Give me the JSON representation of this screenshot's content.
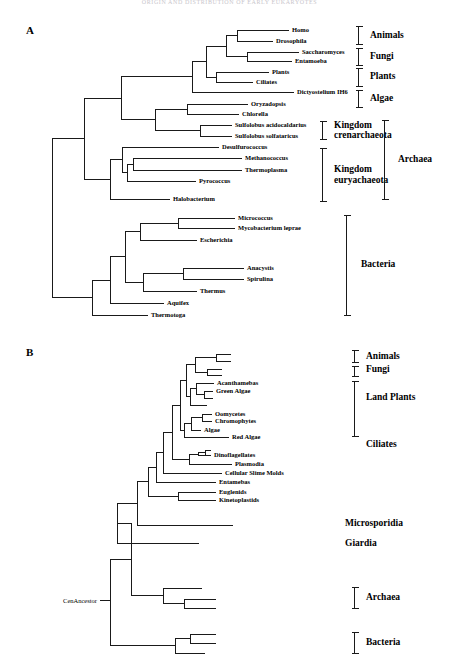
{
  "document": {
    "running_head": "ORIGIN AND DISTRIBUTION OF EARLY EUKARYOTES",
    "width": 459,
    "height": 670,
    "line_color": "#1a1a1a",
    "background": "#ffffff"
  },
  "panels": [
    {
      "letter": "A",
      "tips": [
        {
          "label": "Homo",
          "x": 289,
          "y": 30,
          "side": "right"
        },
        {
          "label": "Drosophila",
          "x": 273,
          "y": 41,
          "side": "right"
        },
        {
          "label": "Saccharomyces",
          "x": 299,
          "y": 52,
          "side": "right"
        },
        {
          "label": "Entamoeba",
          "x": 292,
          "y": 61,
          "side": "right"
        },
        {
          "label": "Plants",
          "x": 269,
          "y": 72,
          "side": "right"
        },
        {
          "label": "Ciliates",
          "x": 253,
          "y": 82,
          "side": "right"
        },
        {
          "label": "Dictyostelium IH6",
          "x": 294,
          "y": 92,
          "side": "right"
        },
        {
          "label": "Oryzadopsis",
          "x": 248,
          "y": 104,
          "side": "right"
        },
        {
          "label": "Chlorella",
          "x": 239,
          "y": 114,
          "side": "right"
        },
        {
          "label": "Sulfolobus acidocaldarius",
          "x": 232,
          "y": 125,
          "side": "right"
        },
        {
          "label": "Sulfolobus solfataricus",
          "x": 232,
          "y": 136,
          "side": "right"
        },
        {
          "label": "Desulfurococcus",
          "x": 219,
          "y": 147,
          "side": "right"
        },
        {
          "label": "Methanococcus",
          "x": 242,
          "y": 158,
          "side": "right"
        },
        {
          "label": "Thermoplasma",
          "x": 242,
          "y": 170,
          "side": "right"
        },
        {
          "label": "Pyrococcus",
          "x": 196,
          "y": 181,
          "side": "right"
        },
        {
          "label": "Halobacterium",
          "x": 170,
          "y": 199,
          "side": "right"
        },
        {
          "label": "Micrococcus",
          "x": 235,
          "y": 218,
          "side": "right"
        },
        {
          "label": "Mycobacterium leprae",
          "x": 235,
          "y": 228,
          "side": "right"
        },
        {
          "label": "Escherichia",
          "x": 197,
          "y": 240,
          "side": "right"
        },
        {
          "label": "Anacystis",
          "x": 244,
          "y": 268,
          "side": "right"
        },
        {
          "label": "Spirulina",
          "x": 244,
          "y": 279,
          "side": "right"
        },
        {
          "label": "Thermus",
          "x": 197,
          "y": 291,
          "side": "right"
        },
        {
          "label": "Aquifex",
          "x": 164,
          "y": 303,
          "side": "right"
        },
        {
          "label": "Thermotoga",
          "x": 148,
          "y": 315,
          "side": "right"
        }
      ],
      "groups": [
        {
          "label": "Animals",
          "x": 370,
          "y": 35.5,
          "top": 26,
          "bottom": 45,
          "bracket_x": 358,
          "lines": 1
        },
        {
          "label": "Fungi",
          "x": 370,
          "y": 56.5,
          "top": 48,
          "bottom": 66,
          "bracket_x": 358,
          "lines": 1
        },
        {
          "label": "Plants",
          "x": 370,
          "y": 77,
          "top": 68,
          "bottom": 87,
          "bracket_x": 358,
          "lines": 1
        },
        {
          "label": "Algae",
          "x": 370,
          "y": 99,
          "top": 90,
          "bottom": 108,
          "bracket_x": 358,
          "lines": 1
        },
        {
          "label": "Kingdom crenarchaeota",
          "x": 334,
          "y": 130.5,
          "top": 121,
          "bottom": 140,
          "bracket_x": 322,
          "lines": 2
        },
        {
          "label": "Kingdom euryachaeota",
          "x": 334,
          "y": 175,
          "top": 148,
          "bottom": 202,
          "bracket_x": 322,
          "lines": 2
        },
        {
          "label": "Archaea",
          "x": 398,
          "y": 160,
          "top": 120,
          "bottom": 200,
          "bracket_x": 384,
          "lines": 1
        },
        {
          "label": "Bacteria",
          "x": 361,
          "y": 265,
          "top": 215,
          "bottom": 316,
          "bracket_x": 346,
          "lines": 1
        }
      ]
    },
    {
      "letter": "B",
      "ancestor_label": "CenAncestor",
      "tips": [
        {
          "label": "",
          "x": 231,
          "y": 354,
          "side": "right"
        },
        {
          "label": "",
          "x": 231,
          "y": 361,
          "side": "right"
        },
        {
          "label": "",
          "x": 222,
          "y": 369,
          "side": "right"
        },
        {
          "label": "",
          "x": 222,
          "y": 375,
          "side": "right"
        },
        {
          "label": "Acanthamebas",
          "x": 214,
          "y": 383,
          "side": "right"
        },
        {
          "label": "Green Algae",
          "x": 213,
          "y": 391,
          "side": "right"
        },
        {
          "label": "",
          "x": 213,
          "y": 398,
          "side": "right"
        },
        {
          "label": "",
          "x": 207,
          "y": 405,
          "side": "right"
        },
        {
          "label": "Oomycetes",
          "x": 212,
          "y": 414,
          "side": "right"
        },
        {
          "label": "Chromophytes",
          "x": 212,
          "y": 421,
          "side": "right"
        },
        {
          "label": "Algae",
          "x": 201,
          "y": 430,
          "side": "right"
        },
        {
          "label": "Red Algae",
          "x": 229,
          "y": 437,
          "side": "right"
        },
        {
          "label": "Dinoflagellates",
          "x": 211,
          "y": 455,
          "side": "right"
        },
        {
          "label": "Plasmodia",
          "x": 232,
          "y": 464,
          "side": "right"
        },
        {
          "label": "Cellular Slime Molds",
          "x": 222,
          "y": 473,
          "side": "right"
        },
        {
          "label": "Entamebas",
          "x": 216,
          "y": 482,
          "side": "right"
        },
        {
          "label": "Euglenids",
          "x": 216,
          "y": 492,
          "side": "right"
        },
        {
          "label": "Kinetoplastids",
          "x": 216,
          "y": 500,
          "side": "right"
        },
        {
          "label": "",
          "x": 233,
          "y": 525,
          "side": "right"
        },
        {
          "label": "",
          "x": 199,
          "y": 543,
          "side": "right"
        },
        {
          "label": "",
          "x": 202,
          "y": 588,
          "side": "right"
        },
        {
          "label": "",
          "x": 216,
          "y": 599,
          "side": "right"
        },
        {
          "label": "",
          "x": 216,
          "y": 608,
          "side": "right"
        },
        {
          "label": "",
          "x": 216,
          "y": 634,
          "side": "right"
        },
        {
          "label": "",
          "x": 216,
          "y": 643,
          "side": "right"
        },
        {
          "label": "",
          "x": 205,
          "y": 653,
          "side": "right"
        }
      ],
      "groups": [
        {
          "label": "Animals",
          "x": 366,
          "y": 357,
          "top": 350,
          "bottom": 363,
          "bracket_x": 354,
          "lines": 1
        },
        {
          "label": "Fungi",
          "x": 366,
          "y": 370,
          "top": 366,
          "bottom": 377,
          "bracket_x": 354,
          "lines": 1
        },
        {
          "label": "Land Plants",
          "x": 366,
          "y": 398,
          "top": 381,
          "bottom": 437,
          "bracket_x": 354,
          "lines": 1
        },
        {
          "label": "Ciliates",
          "x": 366,
          "y": 445,
          "top": null,
          "bottom": null,
          "bracket_x": null,
          "lines": 1
        },
        {
          "label": "Microsporidia",
          "x": 345,
          "y": 524,
          "top": null,
          "bottom": null,
          "bracket_x": null,
          "lines": 1
        },
        {
          "label": "Giardia",
          "x": 345,
          "y": 544,
          "top": null,
          "bottom": null,
          "bracket_x": null,
          "lines": 1
        },
        {
          "label": "Archaea",
          "x": 366,
          "y": 598,
          "top": 587,
          "bottom": 609,
          "bracket_x": 354,
          "lines": 1
        },
        {
          "label": "Bacteria",
          "x": 366,
          "y": 643,
          "top": 632,
          "bottom": 654,
          "bracket_x": 354,
          "lines": 1
        }
      ]
    }
  ]
}
